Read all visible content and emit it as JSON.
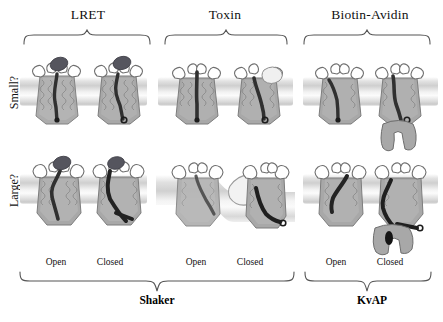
{
  "figure": {
    "columns": [
      {
        "id": "lret",
        "title": "LRET"
      },
      {
        "id": "toxin",
        "title": "Toxin"
      },
      {
        "id": "biotin_avidin",
        "title": "Biotin-Avidin"
      }
    ],
    "rows": [
      {
        "id": "small",
        "label": "Small?"
      },
      {
        "id": "large",
        "label": "Large?"
      }
    ],
    "state_labels": [
      {
        "id": "lret-open",
        "text": "Open"
      },
      {
        "id": "lret-closed",
        "text": "Closed"
      },
      {
        "id": "toxin-open",
        "text": "Open"
      },
      {
        "id": "toxin-closed",
        "text": "Closed"
      },
      {
        "id": "biotin-open",
        "text": "Open"
      },
      {
        "id": "biotin-closed",
        "text": "Closed"
      }
    ],
    "groups": [
      {
        "id": "shaker",
        "label": "Shaker"
      },
      {
        "id": "kvap",
        "label": "KvAP"
      }
    ],
    "colors": {
      "text": "#111111",
      "brace": "#555555",
      "membrane_light": "#f4f4f4",
      "membrane_mid": "#cfcfcf",
      "protein_body": "#9a9a9a",
      "protein_dark": "#3a3a3a",
      "probe_dark": "#4a4a52",
      "avidin_gray": "#a8a8a8",
      "toxin_pale": "#ededed"
    }
  }
}
